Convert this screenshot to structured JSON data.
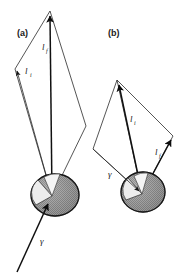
{
  "figure": {
    "title_visible": false,
    "background_color": "#ffffff",
    "ink_color": "#1b1b1b"
  },
  "panels": [
    {
      "id": "a",
      "label": "(a)",
      "label_pos": {
        "x": 17,
        "y": 36
      },
      "description": "Collinear / small-angle geometry: initial and final angular momentum vectors nearly parallel, gamma ray incident from lower left.",
      "sphere": {
        "cx": 55,
        "cy": 195,
        "rx": 24,
        "ry": 21,
        "fill_color": "#8f8f8f",
        "edge_color": "#151515",
        "highlight_color": "#e8e8e8"
      },
      "origin": {
        "x": 52,
        "y": 196
      },
      "vectors": [
        {
          "name": "l_i",
          "symbol": "l",
          "subscript": "i",
          "label": "l",
          "sub_label": "i",
          "label_pos": {
            "x": 25,
            "y": 74
          },
          "tail": {
            "x": 52,
            "y": 196
          },
          "tip": {
            "x": 15,
            "y": 69
          },
          "style": "thin",
          "arrowhead": true
        },
        {
          "name": "l_f",
          "symbol": "l",
          "subscript": "f",
          "label": "l",
          "sub_label": "f",
          "label_pos": {
            "x": 42,
            "y": 50
          },
          "tail": {
            "x": 52,
            "y": 196
          },
          "tip": {
            "x": 50,
            "y": 11
          },
          "style": "thick",
          "arrowhead": true
        },
        {
          "name": "gamma",
          "symbol": "γ",
          "subscript": "",
          "label": "γ",
          "sub_label": "",
          "label_pos": {
            "x": 40,
            "y": 244
          },
          "tail": {
            "x": 17,
            "y": 272
          },
          "tip": {
            "x": 46,
            "y": 202
          },
          "style": "thick",
          "arrowhead": true
        }
      ],
      "parallelogram": {
        "points": [
          {
            "x": 52,
            "y": 196
          },
          {
            "x": 15,
            "y": 69
          },
          {
            "x": 50,
            "y": 11
          },
          {
            "x": 86,
            "y": 126
          }
        ],
        "closure_points": [
          {
            "x": 50,
            "y": 11
          },
          {
            "x": 86,
            "y": 126
          },
          {
            "x": 52,
            "y": 196
          }
        ],
        "style": "thin"
      }
    },
    {
      "id": "b",
      "label": "(b)",
      "label_pos": {
        "x": 108,
        "y": 36
      },
      "description": "Oblique geometry: initial and final angular momentum vectors at a large relative angle, gamma ray incident from the left.",
      "sphere": {
        "cx": 143,
        "cy": 192,
        "rx": 22,
        "ry": 20,
        "fill_color": "#8f8f8f",
        "edge_color": "#151515",
        "highlight_color": "#e8e8e8"
      },
      "origin": {
        "x": 142,
        "y": 194
      },
      "vectors": [
        {
          "name": "l_i",
          "symbol": "l",
          "subscript": "i",
          "label": "l",
          "sub_label": "i",
          "label_pos": {
            "x": 130,
            "y": 122
          },
          "tail": {
            "x": 142,
            "y": 194
          },
          "tip": {
            "x": 117,
            "y": 80
          },
          "style": "thick",
          "arrowhead": true
        },
        {
          "name": "l_f",
          "symbol": "l",
          "subscript": "f",
          "label": "l",
          "sub_label": "f",
          "label_pos": {
            "x": 155,
            "y": 155
          },
          "tail": {
            "x": 142,
            "y": 194
          },
          "tip": {
            "x": 173,
            "y": 136
          },
          "style": "thick",
          "arrowhead": true
        },
        {
          "name": "gamma",
          "symbol": "γ",
          "subscript": "",
          "label": "γ",
          "sub_label": "",
          "label_pos": {
            "x": 108,
            "y": 177
          },
          "tail": {
            "x": 93,
            "y": 149
          },
          "tip": {
            "x": 137,
            "y": 190
          },
          "style": "thin",
          "arrowhead": true
        }
      ],
      "parallelogram": {
        "points": [
          {
            "x": 142,
            "y": 194
          },
          {
            "x": 117,
            "y": 80
          },
          {
            "x": 173,
            "y": 136
          },
          {
            "x": 93,
            "y": 149
          }
        ],
        "closure_points": [
          {
            "x": 117,
            "y": 80
          },
          {
            "x": 173,
            "y": 136
          },
          {
            "x": 142,
            "y": 194
          },
          {
            "x": 93,
            "y": 149
          },
          {
            "x": 117,
            "y": 80
          }
        ],
        "style": "thin"
      }
    }
  ],
  "legend": {
    "symbols": [
      {
        "symbol": "l_i",
        "meaning_label": "l",
        "sub": "i"
      },
      {
        "symbol": "l_f",
        "meaning_label": "l",
        "sub": "f"
      },
      {
        "symbol": "gamma",
        "meaning_label": "γ",
        "sub": ""
      }
    ]
  }
}
